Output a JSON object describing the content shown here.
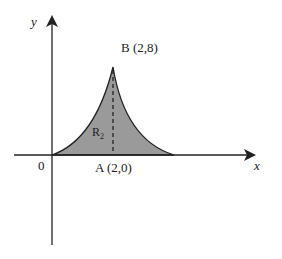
{
  "diagram": {
    "axes": {
      "x_label": "x",
      "y_label": "y",
      "origin_label": "0"
    },
    "points": {
      "B": {
        "label": "B (2,8)"
      },
      "A": {
        "label": "A (2,0)"
      }
    },
    "region": {
      "label": "R",
      "subscript": "2"
    },
    "colors": {
      "fill": "#9a9a9a",
      "stroke": "#222222"
    }
  }
}
